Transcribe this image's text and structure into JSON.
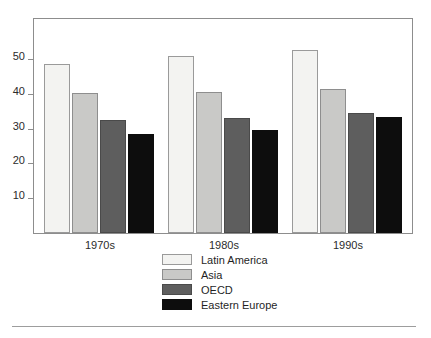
{
  "chart_data": {
    "type": "bar",
    "title": "",
    "subtitle": "",
    "xlabel": "",
    "ylabel": "",
    "categories": [
      "1970s",
      "1980s",
      "1990s"
    ],
    "series": [
      {
        "name": "Latin America",
        "color": "#f3f3f1",
        "values": [
          48.5,
          51.0,
          52.5
        ]
      },
      {
        "name": "Asia",
        "color": "#c9c9c7",
        "values": [
          40.3,
          40.6,
          41.5
        ]
      },
      {
        "name": "OECD",
        "color": "#5e5e5e",
        "values": [
          32.5,
          33.0,
          34.6
        ]
      },
      {
        "name": "Eastern Europe",
        "color": "#0d0d0d",
        "values": [
          28.5,
          29.6,
          33.3
        ]
      }
    ],
    "ylim": [
      0,
      61.5
    ],
    "yticks": [
      10,
      20,
      30,
      40,
      50
    ],
    "ytick_labels": [
      "10",
      "20",
      "30",
      "40",
      "50"
    ],
    "grid": false,
    "legend_position": "bottom-center",
    "frame": true
  },
  "legend": {
    "entries": [
      {
        "label": "Latin America"
      },
      {
        "label": "Asia"
      },
      {
        "label": "OECD"
      },
      {
        "label": "Eastern Europe"
      }
    ]
  },
  "axis": {
    "y_tick_labels": [
      "50",
      "40",
      "30",
      "20",
      "10"
    ],
    "x_tick_labels": [
      "1970s",
      "1980s",
      "1990s"
    ]
  }
}
